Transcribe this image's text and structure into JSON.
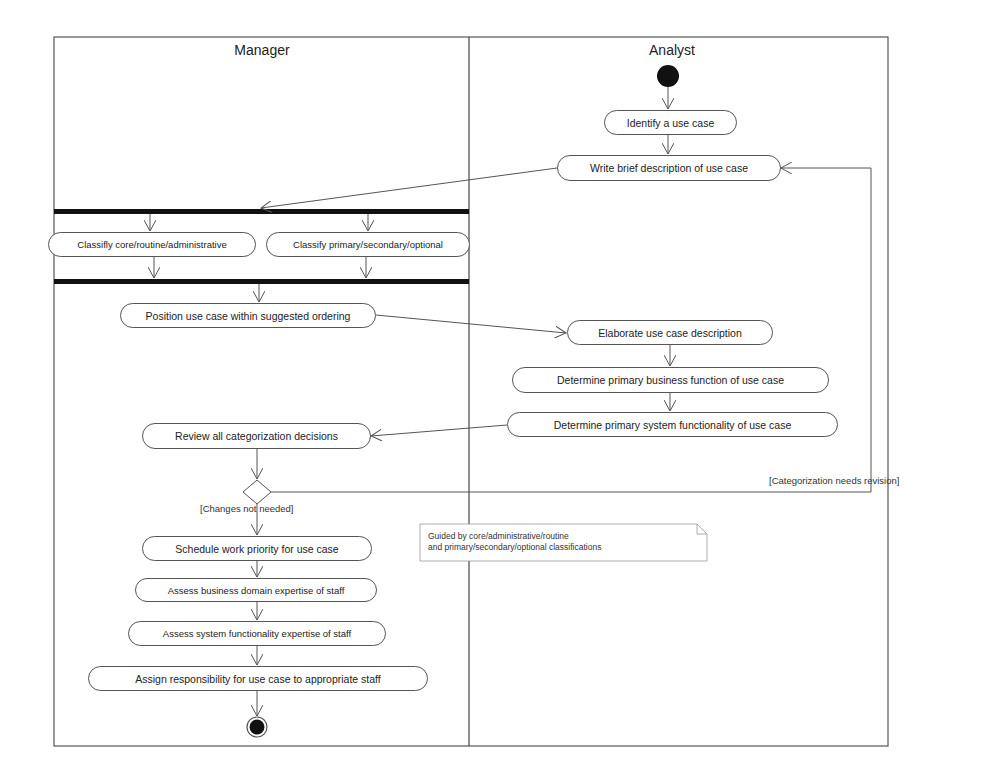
{
  "diagram": {
    "type": "UML activity diagram",
    "swimlanes": [
      {
        "id": "manager",
        "title": "Manager"
      },
      {
        "id": "analyst",
        "title": "Analyst"
      }
    ],
    "activities": {
      "identify": "Identify a use case",
      "write_brief": "Write brief description of use case",
      "classify_core": "Classifly core/routine/administrative",
      "classify_primary": "Classify primary/secondary/optional",
      "position": "Position use case within suggested ordering",
      "elaborate": "Elaborate use case description",
      "business_function": "Determine primary business function of use case",
      "system_functionality": "Determine primary system functionality of use case",
      "review": "Review all categorization decisions",
      "schedule": "Schedule work priority for use case",
      "assess_business": "Assess business domain expertise of staff",
      "assess_system": "Assess system functionality expertise of staff",
      "assign": "Assign responsibility for use case to appropriate staff"
    },
    "guards": {
      "changes_not_needed": "[Changes not needed]",
      "needs_revision": "[Categorization needs revision]"
    },
    "note": {
      "line1": "Guided by core/administrative/routine",
      "line2": "and primary/secondary/optional classifications"
    },
    "colors": {
      "line": "#555555",
      "node_fill": "#111111",
      "background": "#ffffff"
    }
  }
}
